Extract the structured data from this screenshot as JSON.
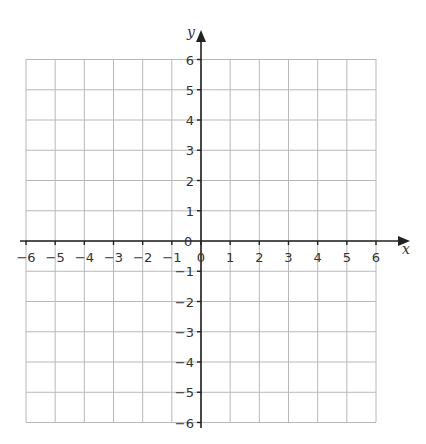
{
  "diagram": {
    "type": "coordinate-grid",
    "x_axis": {
      "label": "x",
      "min": -6,
      "max": 6,
      "ticks": [
        "-6",
        "-5",
        "-4",
        "-3",
        "-2",
        "-1",
        "0",
        "1",
        "2",
        "3",
        "4",
        "5",
        "6"
      ]
    },
    "y_axis": {
      "label": "y",
      "min": -6,
      "max": 6,
      "ticks": [
        "6",
        "5",
        "4",
        "3",
        "2",
        "1",
        "0",
        "-1",
        "-2",
        "-3",
        "-4",
        "-5",
        "-6"
      ]
    },
    "origin_label": "0",
    "colors": {
      "grid": "#b8b8b8",
      "axis": "#222222",
      "text": "#333333"
    }
  }
}
